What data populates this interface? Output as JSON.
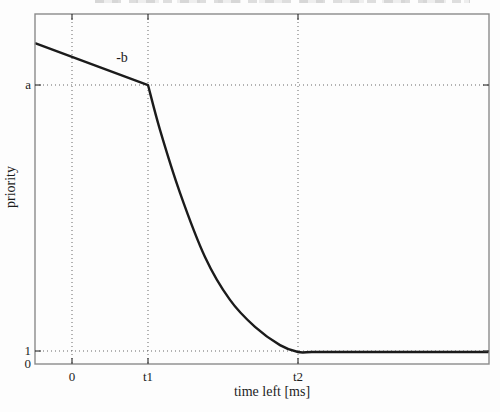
{
  "figure": {
    "colors": {
      "background": "#fdfdfd",
      "frame": "#8a8a8a",
      "grid": "#4f4f4f",
      "tick": "#3a3a3a",
      "curve": "#1b1b1b",
      "text": "#1c1c1c"
    }
  },
  "chart_data": {
    "type": "line",
    "title": "",
    "xlabel": "time left [ms]",
    "ylabel": "priority",
    "box": true,
    "grid": "dotted-at-ticks",
    "legend": null,
    "x_ticks": [
      {
        "label": "0",
        "pos": 0.0815,
        "gridline": true
      },
      {
        "label": "t1",
        "pos": 0.2489,
        "gridline": true
      },
      {
        "label": "t2",
        "pos": 0.5793,
        "gridline": true
      }
    ],
    "y_ticks": [
      {
        "label": "a",
        "pos": 0.2029,
        "gridline": true
      },
      {
        "label": "1",
        "pos": 0.9629,
        "gridline": true
      },
      {
        "label": "0",
        "pos": 1.0,
        "gridline": false
      }
    ],
    "annotations": [
      {
        "text": "-b",
        "x": 0.1916,
        "y": 0.1257
      }
    ],
    "series": [
      {
        "name": "priority-curve",
        "straight_first_segment": true,
        "points": [
          [
            0.0,
            0.083
          ],
          [
            0.2489,
            0.203
          ],
          [
            0.2753,
            0.331
          ],
          [
            0.3194,
            0.511
          ],
          [
            0.3744,
            0.694
          ],
          [
            0.4295,
            0.817
          ],
          [
            0.4846,
            0.894
          ],
          [
            0.5396,
            0.946
          ],
          [
            0.5793,
            0.9657
          ],
          [
            0.61,
            0.9657
          ],
          [
            0.66,
            0.9657
          ],
          [
            0.82,
            0.9657
          ],
          [
            1.0,
            0.9657
          ]
        ]
      }
    ]
  }
}
